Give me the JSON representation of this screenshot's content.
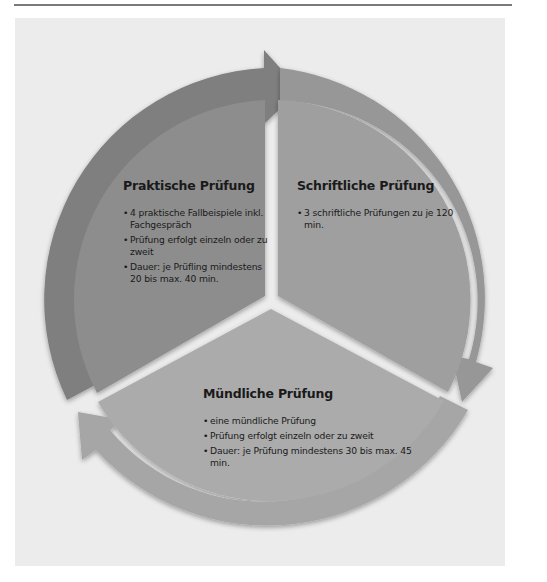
{
  "diagram": {
    "type": "cycle",
    "colors": {
      "page_background": "#ffffff",
      "panel_background": "#ececec",
      "rule_line": "#7a7a7a",
      "sector_dark": "#8d8d8d",
      "sector_mid": "#9f9f9f",
      "sector_light": "#ababab",
      "ring_dark": "#7f7f7f",
      "ring_mid": "#979797",
      "ring_light": "#a6a6a6",
      "text": "#1a1a1a"
    },
    "sectors": [
      {
        "id": "praktisch",
        "title": "Praktische Prüfung",
        "bullets": [
          "4 praktische Fallbeispiele inkl. Fachgespräch",
          "Prüfung erfolgt einzeln oder zu zweit",
          "Dauer: je Prüfling mindestens 20 bis max. 40 min."
        ]
      },
      {
        "id": "schriftlich",
        "title": "Schriftliche Prüfung",
        "bullets": [
          "3 schriftliche Prüfungen zu je 120 min."
        ]
      },
      {
        "id": "muendlich",
        "title": "Mündliche Prüfung",
        "bullets": [
          "eine mündliche Prüfung",
          "Prüfung erfolgt einzeln oder zu zweit",
          "Dauer: je Prüfung mindestens 30 bis max. 45 min."
        ]
      }
    ],
    "arrows": [
      {
        "from": "praktisch",
        "to": "schriftlich",
        "icon": "curved-arrow-icon"
      },
      {
        "from": "schriftlich",
        "to": "muendlich",
        "icon": "curved-arrow-icon"
      },
      {
        "from": "muendlich",
        "to": "praktisch",
        "icon": "curved-arrow-icon"
      }
    ]
  }
}
